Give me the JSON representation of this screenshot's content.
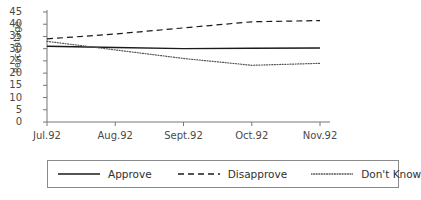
{
  "chart_data": {
    "type": "line",
    "title": "",
    "xlabel": "",
    "ylabel": "Percentage",
    "categories": [
      "Jul.92",
      "Aug.92",
      "Sept.92",
      "Oct.92",
      "Nov.92"
    ],
    "ylim": [
      0,
      45
    ],
    "yticks": [
      0,
      5,
      10,
      15,
      20,
      25,
      30,
      35,
      40,
      45
    ],
    "grid": false,
    "legend_position": "below",
    "series": [
      {
        "name": "Approve",
        "style": "solid",
        "color": "#1a1a1a",
        "values": [
          31,
          30.5,
          30,
          30.2,
          30.3
        ]
      },
      {
        "name": "Disapprove",
        "style": "dashed",
        "color": "#1a1a1a",
        "values": [
          34,
          36,
          38.5,
          41,
          41.5
        ]
      },
      {
        "name": "Don't Know",
        "style": "dotted",
        "color": "#555555",
        "values": [
          33,
          29.5,
          26,
          23.2,
          24
        ]
      }
    ]
  },
  "axis": {
    "ylabel": "Percentage",
    "ytick_labels": [
      "45",
      "40",
      "35",
      "30",
      "25",
      "20",
      "15",
      "10",
      "5",
      "0"
    ],
    "xtick_labels": [
      "Jul.92",
      "Aug.92",
      "Sept.92",
      "Oct.92",
      "Nov.92"
    ]
  },
  "legend": {
    "entries": [
      {
        "label": "Approve",
        "style": "solid"
      },
      {
        "label": "Disapprove",
        "style": "dashed"
      },
      {
        "label": "Don't Know",
        "style": "dotted"
      }
    ]
  }
}
